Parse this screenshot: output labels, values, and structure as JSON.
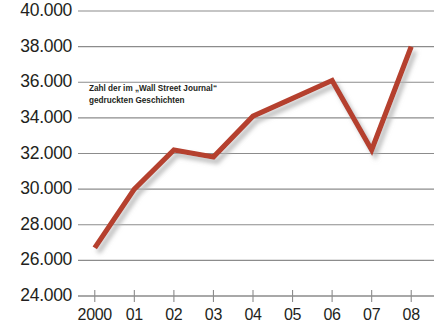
{
  "chart_data": {
    "type": "line",
    "title": "",
    "subtitle": "",
    "xlabel": "",
    "ylabel": "",
    "categories": [
      "2000",
      "01",
      "02",
      "03",
      "04",
      "05",
      "06",
      "07",
      "08"
    ],
    "series": [
      {
        "name": "Zahl der im „Wall Street Journal“ gedruckten Geschichten",
        "color": "#b5402e",
        "values": [
          26700,
          30000,
          32200,
          31800,
          34100,
          35100,
          36100,
          32200,
          38000
        ]
      }
    ],
    "ylim": [
      24000,
      40000
    ],
    "ytick_values": [
      40000,
      38000,
      36000,
      34000,
      32000,
      30000,
      28000,
      26000,
      24000
    ],
    "ytick_labels": [
      "40.000",
      "38.000",
      "36.000",
      "34.000",
      "32.000",
      "30.000",
      "28.000",
      "26.000",
      "24.000"
    ],
    "xtick_labels": [
      "2000",
      "01",
      "02",
      "03",
      "04",
      "05",
      "06",
      "07",
      "08"
    ],
    "grid": true,
    "grid_axis": "y",
    "legend": "none",
    "annotations": [
      {
        "text_line_1": "Zahl der im „Wall Street Journal“",
        "text_line_2": "gedruckten Geschichten",
        "x": 89,
        "y": 83
      }
    ]
  },
  "style": {
    "line_color": "#b5402e",
    "grid_color": "#8c8c8c",
    "axis_color": "#8c8c8c",
    "label_color": "#231f20",
    "shadow_color": "#c9c9c9",
    "background": "#ffffff"
  },
  "annotation": {
    "line1": "Zahl der im „Wall Street Journal“",
    "line2": "gedruckten Geschichten"
  }
}
